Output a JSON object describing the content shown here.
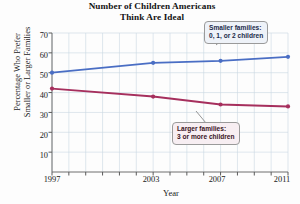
{
  "chart_data": {
    "type": "line",
    "title": "Number of Children Americans Think Are Ideal",
    "title_line1": "Number of Children Americans",
    "title_line2": "Think Are Ideal",
    "xlabel": "Year",
    "ylabel": "Percentage Who Prefer Smaller or Larger Families",
    "ylabel_line1": "Percentage Who Prefer",
    "ylabel_line2": "Smaller or Larger Families",
    "x": [
      1997,
      2003,
      2007,
      2011
    ],
    "categories": [
      "1997",
      "2003",
      "2007",
      "2011"
    ],
    "xtick_labels": [
      "1997",
      "2003",
      "2007",
      "2011"
    ],
    "ytick_labels": [
      "10",
      "20",
      "30",
      "40",
      "50",
      "60",
      "70"
    ],
    "ytick_values": [
      10,
      20,
      30,
      40,
      50,
      60,
      70
    ],
    "xlim": [
      1997,
      2011
    ],
    "ylim": [
      0,
      70
    ],
    "grid": true,
    "legend_position": "annotations",
    "series": [
      {
        "name": "Smaller families: 0, 1, or 2 children",
        "color": "#4a6ec4",
        "values": [
          50,
          55,
          56,
          58
        ]
      },
      {
        "name": "Larger families: 3 or more children",
        "color": "#a62f5d",
        "values": [
          42,
          38,
          34,
          33
        ]
      }
    ],
    "annotations": [
      {
        "id": "smaller",
        "line1": "Smaller families:",
        "line2": "0, 1, or 2 children",
        "fill": "#eef2f8",
        "text_color": "#1b2a4a"
      },
      {
        "id": "larger",
        "line1": "Larger families:",
        "line2": "3 or more children",
        "fill": "#f7eef2",
        "text_color": "#3a1322"
      }
    ]
  }
}
